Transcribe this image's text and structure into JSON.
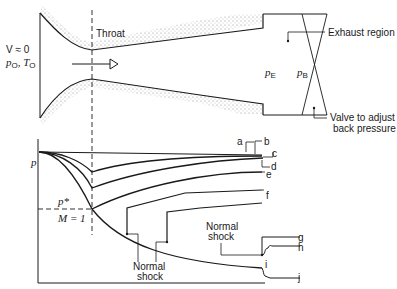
{
  "nozzle": {
    "throat_label": "Throat",
    "inlet_label_v": "V ≈ 0",
    "inlet_label_p": "p",
    "inlet_label_p_sub": "O",
    "inlet_label_t": "T",
    "inlet_label_t_sub": "O",
    "pe_label": "p",
    "pe_sub": "E",
    "pb_label": "p",
    "pb_sub": "B",
    "exhaust_label": "Exhaust region",
    "valve_label_line1": "Valve to adjust",
    "valve_label_line2": "back pressure",
    "flow_arrow": "arrow-right-icon"
  },
  "graph": {
    "y_axis_label": "p",
    "pstar_label": "p*",
    "mach_label": "M = 1",
    "normal_shock_label_line1": "Normal",
    "normal_shock_label_line2": "shock",
    "normal_shock_label2_line1": "Normal",
    "normal_shock_label2_line2": "shock",
    "curve_labels": [
      "a",
      "b",
      "c",
      "d",
      "e",
      "f",
      "g",
      "h",
      "i",
      "j"
    ]
  }
}
